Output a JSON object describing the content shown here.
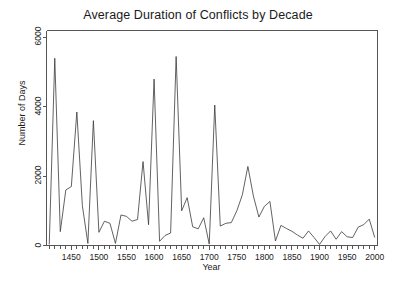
{
  "chart_data": {
    "type": "line",
    "title": "Average Duration of Conflicts by Decade",
    "xlabel": "Year",
    "ylabel": "Number of Days",
    "xlim": [
      1405,
      2005
    ],
    "ylim": [
      0,
      6200
    ],
    "grid": false,
    "legend": null,
    "xticks": [
      1400,
      1450,
      1500,
      1550,
      1600,
      1650,
      1700,
      1750,
      1800,
      1850,
      1900,
      1950,
      2000
    ],
    "xtick_labels": [
      "1400",
      "1450",
      "1500",
      "1550",
      "1600",
      "1650",
      "1700",
      "1750",
      "1800",
      "1850",
      "1900",
      "1950",
      "2000"
    ],
    "minor_xtick_step": 10,
    "yticks": [
      0,
      2000,
      4000,
      6000
    ],
    "ytick_labels": [
      "0",
      "2000",
      "4000",
      "6000"
    ],
    "line_color": "#3a3a3a",
    "line_width": 0.8,
    "x": [
      1410,
      1420,
      1430,
      1440,
      1450,
      1460,
      1470,
      1480,
      1490,
      1500,
      1510,
      1520,
      1530,
      1540,
      1550,
      1560,
      1570,
      1580,
      1590,
      1600,
      1610,
      1620,
      1630,
      1640,
      1650,
      1660,
      1670,
      1680,
      1690,
      1700,
      1710,
      1720,
      1730,
      1740,
      1750,
      1760,
      1770,
      1780,
      1790,
      1800,
      1810,
      1820,
      1830,
      1840,
      1850,
      1860,
      1870,
      1880,
      1890,
      1900,
      1910,
      1920,
      1930,
      1940,
      1950,
      1960,
      1970,
      1980,
      1990,
      2000
    ],
    "values": [
      30,
      5400,
      400,
      1600,
      1700,
      3850,
      1150,
      60,
      3600,
      380,
      700,
      640,
      60,
      880,
      840,
      700,
      750,
      2420,
      600,
      4800,
      120,
      290,
      360,
      5450,
      1000,
      1380,
      540,
      480,
      800,
      40,
      4050,
      560,
      640,
      660,
      1000,
      1460,
      2280,
      1430,
      820,
      1130,
      1270,
      130,
      580,
      490,
      410,
      300,
      210,
      420,
      230,
      30,
      260,
      420,
      180,
      400,
      250,
      230,
      530,
      600,
      760,
      230
    ],
    "series": [
      {
        "name": "Average duration",
        "values": [
          30,
          5400,
          400,
          1600,
          1700,
          3850,
          1150,
          60,
          3600,
          380,
          700,
          640,
          60,
          880,
          840,
          700,
          750,
          2420,
          600,
          4800,
          120,
          290,
          360,
          5450,
          1000,
          1380,
          540,
          480,
          800,
          40,
          4050,
          560,
          640,
          660,
          1000,
          1460,
          2280,
          1430,
          820,
          1130,
          1270,
          130,
          580,
          490,
          410,
          300,
          210,
          420,
          230,
          30,
          260,
          420,
          180,
          400,
          250,
          230,
          530,
          600,
          760,
          230
        ]
      }
    ]
  },
  "axes": {
    "frame_color": "#555555"
  }
}
